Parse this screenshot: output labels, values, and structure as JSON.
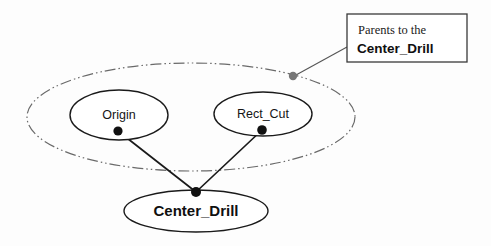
{
  "diagram": {
    "background_color": "#fdfdfd",
    "nodes": [
      {
        "id": "origin",
        "label": "Origin",
        "shape": "ellipse",
        "cx": 119,
        "cy": 115,
        "rx": 49,
        "ry": 25,
        "stroke": "#1a1a1a",
        "fill": "#ffffff",
        "label_style": "regular",
        "anchor_dot": {
          "cx": 118,
          "cy": 131,
          "r": 4.6,
          "fill": "#111111"
        }
      },
      {
        "id": "rect_cut",
        "label": "Rect_Cut",
        "shape": "ellipse",
        "cx": 263,
        "cy": 114,
        "rx": 49,
        "ry": 22,
        "stroke": "#1a1a1a",
        "fill": "#ffffff",
        "label_style": "regular",
        "anchor_dot": {
          "cx": 262,
          "cy": 130,
          "r": 4.8,
          "fill": "#111111"
        }
      },
      {
        "id": "center_drill",
        "label": "Center_Drill",
        "shape": "ellipse",
        "cx": 196,
        "cy": 211,
        "rx": 72,
        "ry": 21,
        "stroke": "#1a1a1a",
        "fill": "#ffffff",
        "label_style": "bold",
        "anchor_dot": {
          "cx": 196,
          "cy": 192,
          "r": 5.0,
          "fill": "#111111"
        }
      }
    ],
    "grouping_ellipse": {
      "id": "parents-group",
      "cx": 191,
      "cy": 117,
      "rx": 164,
      "ry": 54,
      "stroke": "#6a6a6a",
      "style": "dash-dot-dot",
      "dash_pattern": "11 3 1.5 3 1.5 3"
    },
    "edges": [
      {
        "id": "origin-to-center-drill",
        "from": "origin",
        "to": "center_drill",
        "x1": 118,
        "y1": 131,
        "x2": 196,
        "y2": 192,
        "stroke": "#1a1a1a"
      },
      {
        "id": "rect-cut-to-center-drill",
        "from": "rect_cut",
        "to": "center_drill",
        "x1": 262,
        "y1": 130,
        "x2": 196,
        "y2": 192,
        "stroke": "#1a1a1a"
      }
    ],
    "callout": {
      "id": "parents-callout",
      "box": {
        "x": 347,
        "y": 14,
        "width": 120,
        "height": 48,
        "stroke": "#3a3a3a",
        "fill": "#ffffff"
      },
      "line_1": "Parents to the",
      "line_2": "Center_Drill",
      "leader": {
        "x1": 347,
        "y1": 47,
        "x2": 296,
        "y2": 75,
        "stroke": "#555555"
      },
      "leader_dot": {
        "cx": 293,
        "cy": 76,
        "r": 4.2,
        "fill": "#767676"
      }
    }
  }
}
